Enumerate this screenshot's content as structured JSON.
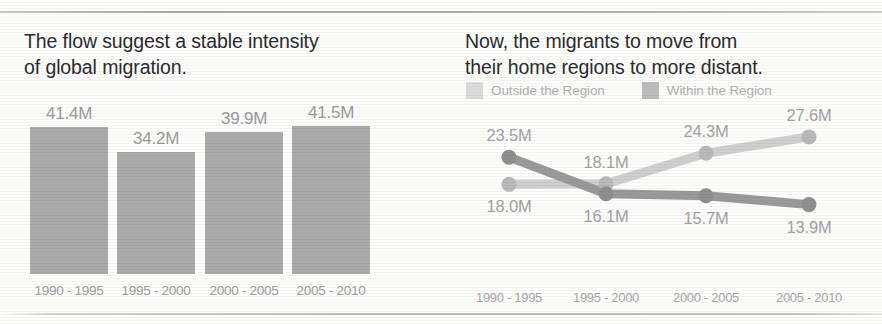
{
  "colors": {
    "bar_fill": "#ababab",
    "series_within": "#9a9a9a",
    "series_outside": "#cfcfcf",
    "headline_text": "#2c2c2c",
    "value_text": "#9a9a9a",
    "axis_text": "#a0a0a0",
    "rule": "#b4b4b4"
  },
  "left_panel": {
    "headline": "The flow suggest a stable intensity\nof global migration."
  },
  "right_panel": {
    "headline": "Now, the migrants to move from\ntheir home regions to more distant.",
    "legend": [
      {
        "label": "Outside the Region",
        "color": "#dcdcdc"
      },
      {
        "label": "Within the Region",
        "color": "#bdbdbd"
      }
    ]
  },
  "chart_data": [
    {
      "type": "bar",
      "title": "The flow suggest a stable intensity of global migration.",
      "categories": [
        "1990 - 1995",
        "1995 - 2000",
        "2000 - 2005",
        "2005 - 2010"
      ],
      "values": [
        41.4,
        34.2,
        39.9,
        41.5
      ],
      "labels": [
        "41.4M",
        "34.2M",
        "39.9M",
        "41.5M"
      ],
      "unit": "M",
      "xlabel": "",
      "ylabel": "",
      "ylim": [
        0,
        45
      ],
      "grid": false,
      "legend": "none"
    },
    {
      "type": "line",
      "title": "Now, the migrants to move from their home regions to more distant.",
      "categories": [
        "1990 - 1995",
        "1995 - 2000",
        "2000 - 2005",
        "2005 - 2010"
      ],
      "series": [
        {
          "name": "Within the Region",
          "color": "#9a9a9a",
          "values": [
            23.5,
            16.1,
            15.7,
            13.9
          ],
          "labels": [
            "23.5M",
            "16.1M",
            "15.7M",
            "13.9M"
          ],
          "label_positions": [
            "above",
            "below",
            "below",
            "below"
          ]
        },
        {
          "name": "Outside the Region",
          "color": "#cfcfcf",
          "values": [
            18.0,
            18.1,
            24.3,
            27.6
          ],
          "labels": [
            "18.0M",
            "18.1M",
            "24.3M",
            "27.6M"
          ],
          "label_positions": [
            "below",
            "above",
            "above",
            "above"
          ]
        }
      ],
      "unit": "M",
      "xlabel": "",
      "ylabel": "",
      "ylim": [
        12,
        29
      ],
      "grid": false,
      "legend": "top"
    }
  ]
}
